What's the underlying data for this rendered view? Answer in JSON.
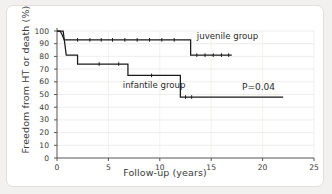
{
  "chart_data": {
    "type": "line",
    "title": "",
    "subtitle": "",
    "xlabel": "Follow-up (years)",
    "ylabel": "Freedom from HT or death (%)",
    "xlim": [
      0,
      25
    ],
    "ylim": [
      0,
      100
    ],
    "xticks": [
      0,
      5,
      10,
      15,
      20,
      25
    ],
    "yticks": [
      0,
      10,
      20,
      30,
      40,
      50,
      60,
      70,
      80,
      90,
      100
    ],
    "grid": "horizontal-faint",
    "legend": "inline-annotations",
    "annotations": [
      {
        "name": "p-value",
        "text": "P=0.04",
        "x": 18.0,
        "y": 55
      },
      {
        "name": "juvenile-label",
        "text": "juvenile group",
        "x": 13.6,
        "y": 95
      },
      {
        "name": "infantile-label",
        "text": "infantile group",
        "x": 6.4,
        "y": 57
      }
    ],
    "series": [
      {
        "name": "juvenile group",
        "style": "step",
        "color": "#1a1a1a",
        "points": [
          [
            0.0,
            100
          ],
          [
            0.3,
            100
          ],
          [
            0.5,
            97
          ],
          [
            0.7,
            93
          ],
          [
            13.0,
            93
          ],
          [
            13.0,
            81
          ],
          [
            17.0,
            81
          ]
        ],
        "censor_marks": [
          [
            2.0,
            93
          ],
          [
            3.2,
            93
          ],
          [
            4.3,
            93
          ],
          [
            5.4,
            93
          ],
          [
            6.6,
            93
          ],
          [
            7.8,
            93
          ],
          [
            9.0,
            93
          ],
          [
            10.2,
            93
          ],
          [
            11.4,
            93
          ],
          [
            13.6,
            81
          ],
          [
            14.4,
            81
          ],
          [
            15.2,
            81
          ],
          [
            16.0,
            81
          ],
          [
            16.7,
            81
          ]
        ]
      },
      {
        "name": "infantile group",
        "style": "step",
        "color": "#1a1a1a",
        "points": [
          [
            0.0,
            100
          ],
          [
            0.6,
            100
          ],
          [
            0.9,
            81
          ],
          [
            2.0,
            81
          ],
          [
            2.0,
            74
          ],
          [
            6.9,
            74
          ],
          [
            6.9,
            65
          ],
          [
            12.0,
            65
          ],
          [
            12.0,
            48
          ],
          [
            22.0,
            48
          ]
        ],
        "censor_marks": [
          [
            4.1,
            74
          ],
          [
            6.0,
            74
          ],
          [
            9.2,
            65
          ],
          [
            12.5,
            48
          ],
          [
            13.1,
            48
          ]
        ]
      }
    ]
  },
  "figure": {
    "y_axis_title": "Freedom from HT or death (%)",
    "x_axis_title": "Follow-up (years)"
  }
}
